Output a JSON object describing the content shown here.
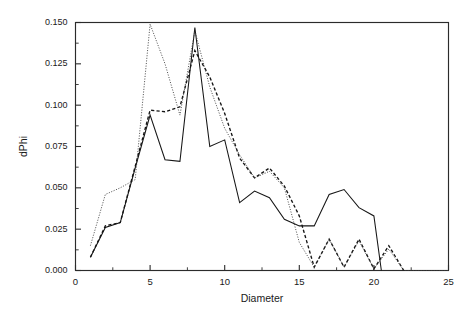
{
  "chart_data": {
    "type": "line",
    "title": "",
    "xlabel": "Diameter",
    "ylabel": "dPhi",
    "xlim": [
      0,
      25
    ],
    "ylim": [
      0.0,
      0.15
    ],
    "grid": false,
    "legend_position": "none",
    "x_ticks": [
      0,
      5,
      10,
      15,
      20,
      25
    ],
    "x_tick_labels": [
      "0",
      "5",
      "10",
      "15",
      "20",
      "25"
    ],
    "x_minor_ticks": [
      2.5,
      7.5,
      12.5,
      17.5,
      22.5
    ],
    "y_ticks": [
      0.0,
      0.025,
      0.05,
      0.075,
      0.1,
      0.125,
      0.15
    ],
    "y_tick_labels": [
      "0.000",
      "0.025",
      "0.050",
      "0.075",
      "0.100",
      "0.125",
      "0.150"
    ],
    "y_minor_ticks": [
      0.0125,
      0.0375,
      0.0625,
      0.0875,
      0.1125,
      0.1375
    ],
    "series": [
      {
        "name": "solid",
        "style": "solid",
        "color": "#151515",
        "x": [
          1,
          2,
          3,
          4,
          5,
          6,
          7,
          8,
          9,
          10,
          11,
          12,
          13,
          14,
          15,
          16,
          17,
          18,
          19,
          20,
          20.5
        ],
        "values": [
          0.008,
          0.026,
          0.029,
          0.062,
          0.094,
          0.067,
          0.066,
          0.147,
          0.075,
          0.079,
          0.041,
          0.048,
          0.044,
          0.031,
          0.027,
          0.027,
          0.046,
          0.049,
          0.038,
          0.033,
          0.0
        ]
      },
      {
        "name": "dashed",
        "style": "dashed",
        "color": "#151515",
        "x": [
          1,
          2,
          3,
          4,
          5,
          6,
          7,
          8,
          9,
          10,
          11,
          12,
          13,
          14,
          15,
          16,
          17,
          18,
          19,
          20,
          21,
          22
        ],
        "values": [
          0.008,
          0.027,
          0.029,
          0.063,
          0.097,
          0.096,
          0.099,
          0.133,
          0.117,
          0.095,
          0.068,
          0.056,
          0.062,
          0.051,
          0.033,
          0.002,
          0.019,
          0.002,
          0.019,
          0.001,
          0.015,
          0.0
        ]
      },
      {
        "name": "dotted",
        "style": "dotted",
        "color": "#3a3a3a",
        "x": [
          1,
          2,
          3,
          4,
          5,
          6,
          7,
          8,
          9,
          10,
          11,
          12,
          13,
          14,
          15,
          16,
          17,
          18,
          19,
          20,
          21,
          22,
          25
        ],
        "values": [
          0.015,
          0.046,
          0.05,
          0.055,
          0.149,
          0.125,
          0.094,
          0.145,
          0.111,
          0.086,
          0.07,
          0.056,
          0.06,
          0.05,
          0.017,
          0.002,
          0.019,
          0.002,
          0.018,
          0.001,
          0.013,
          0.0,
          0.0
        ]
      }
    ]
  }
}
